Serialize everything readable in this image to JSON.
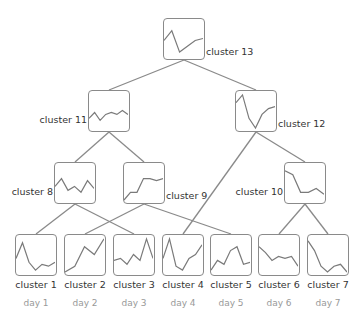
{
  "nodes": [
    {
      "id": "c13",
      "label": "cluster 13",
      "x": 163,
      "y": 18,
      "label_pos": "right",
      "series": [
        0.55,
        0.3,
        0.85,
        0.7,
        0.55,
        0.5
      ]
    },
    {
      "id": "c11",
      "label": "cluster 11",
      "x": 88,
      "y": 90,
      "label_pos": "left",
      "series": [
        0.7,
        0.55,
        0.75,
        0.6,
        0.55,
        0.6,
        0.5,
        0.6
      ]
    },
    {
      "id": "c12",
      "label": "cluster 12",
      "x": 235,
      "y": 90,
      "label_pos": "right",
      "series": [
        0.3,
        0.1,
        0.7,
        0.95,
        0.6,
        0.45,
        0.4
      ]
    },
    {
      "id": "c8",
      "label": "cluster 8",
      "x": 54,
      "y": 162,
      "label_pos": "left",
      "series": [
        0.6,
        0.4,
        0.7,
        0.6,
        0.75,
        0.45,
        0.65
      ]
    },
    {
      "id": "c9",
      "label": "cluster 9",
      "x": 123,
      "y": 162,
      "label_pos": "right",
      "series": [
        0.95,
        0.75,
        0.75,
        0.4,
        0.4,
        0.45,
        0.4
      ]
    },
    {
      "id": "c10",
      "label": "cluster 10",
      "x": 284,
      "y": 162,
      "label_pos": "left",
      "series": [
        0.2,
        0.3,
        0.75,
        0.75,
        0.65,
        0.8
      ]
    },
    {
      "id": "c1",
      "label": "cluster 1",
      "day": "day 1",
      "x": 15,
      "y": 234,
      "label_pos": "below",
      "series": [
        0.6,
        0.2,
        0.7,
        0.9,
        0.75,
        0.8,
        0.7
      ]
    },
    {
      "id": "c2",
      "label": "cluster 2",
      "day": "day 2",
      "x": 64,
      "y": 234,
      "label_pos": "below",
      "series": [
        0.95,
        0.8,
        0.3,
        0.5,
        0.1
      ]
    },
    {
      "id": "c3",
      "label": "cluster 3",
      "day": "day 3",
      "x": 113,
      "y": 234,
      "label_pos": "below",
      "series": [
        0.65,
        0.6,
        0.75,
        0.5,
        0.65,
        0.1,
        0.6
      ]
    },
    {
      "id": "c4",
      "label": "cluster 4",
      "day": "day 4",
      "x": 162,
      "y": 234,
      "label_pos": "below",
      "series": [
        0.6,
        0.1,
        0.8,
        0.9,
        0.6,
        0.5,
        0.25
      ]
    },
    {
      "id": "c5",
      "label": "cluster 5",
      "day": "day 5",
      "x": 210,
      "y": 234,
      "label_pos": "below",
      "series": [
        0.9,
        0.65,
        0.75,
        0.4,
        0.3,
        0.75,
        0.7
      ]
    },
    {
      "id": "c6",
      "label": "cluster 6",
      "day": "day 6",
      "x": 258,
      "y": 234,
      "label_pos": "below",
      "series": [
        0.3,
        0.45,
        0.65,
        0.55,
        0.6,
        0.55,
        0.8
      ]
    },
    {
      "id": "c7",
      "label": "cluster 7",
      "day": "day 7",
      "x": 307,
      "y": 234,
      "label_pos": "below",
      "series": [
        0.15,
        0.4,
        0.8,
        0.95,
        0.8,
        0.75,
        0.95
      ]
    }
  ],
  "edges": [
    [
      "c13",
      "c11"
    ],
    [
      "c13",
      "c12"
    ],
    [
      "c11",
      "c8"
    ],
    [
      "c11",
      "c9"
    ],
    [
      "c12",
      "c4"
    ],
    [
      "c12",
      "c10"
    ],
    [
      "c8",
      "c1"
    ],
    [
      "c8",
      "c3"
    ],
    [
      "c9",
      "c2"
    ],
    [
      "c9",
      "c5"
    ],
    [
      "c10",
      "c6"
    ],
    [
      "c10",
      "c7"
    ]
  ],
  "colors": {
    "edge": "#8a8a8a",
    "line": "#7a7a7a",
    "label": "#333333",
    "day": "#999999"
  }
}
